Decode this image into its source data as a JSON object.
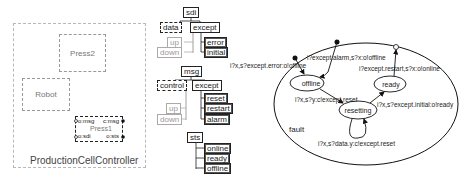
{
  "component_diagram": {
    "container_label": "ProductionCellController",
    "components": [
      {
        "name": "Press2"
      },
      {
        "name": "Robot"
      },
      {
        "name": "Press1",
        "ports": [
          "o:msg",
          "c:msg",
          "o:sdi",
          "o:sts"
        ]
      }
    ]
  },
  "type_trees": {
    "sdi": {
      "root": "sdi",
      "children": [
        "data",
        "except"
      ],
      "data_children": [
        "up",
        "down"
      ],
      "except_children": [
        "error",
        "initial"
      ]
    },
    "msg": {
      "root": "msg",
      "children": [
        "control",
        "except"
      ],
      "control_children": [
        "up",
        "down"
      ],
      "except_children": [
        "reset",
        "restart",
        "alarm"
      ]
    },
    "sts": {
      "root": "sts",
      "children": [
        "online",
        "ready",
        "offline"
      ]
    }
  },
  "state_machine": {
    "superstate": "fault",
    "states": [
      "offline",
      "ready",
      "resetting"
    ],
    "transitions": [
      {
        "label": "i?x,s?except.error:o!offline"
      },
      {
        "label": "i?except.alarm,s?x:o!offline"
      },
      {
        "label": "i?except.restart,s?x:o!online"
      },
      {
        "label": "i?x,s?y:c!except.reset"
      },
      {
        "label": "i?x,s?except.initial:o!ready"
      },
      {
        "label": "i?x,s?data.y:c!except.reset"
      }
    ]
  }
}
